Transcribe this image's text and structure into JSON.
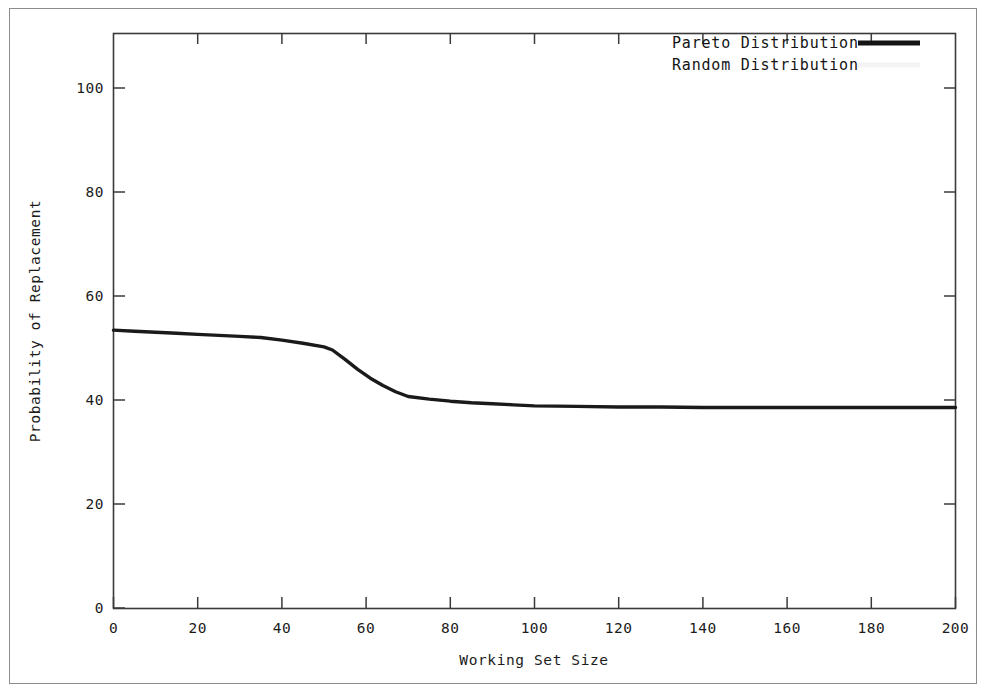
{
  "figure": {
    "background_color": "#ffffff",
    "frame_color": "#8c8c8c",
    "axis_color": "#404040"
  },
  "chart_data": {
    "type": "line",
    "title": "",
    "subtitle": "",
    "xlabel": "Working Set Size",
    "ylabel": "Probability of Replacement",
    "xlim": [
      0,
      200
    ],
    "ylim": [
      0,
      110
    ],
    "xticks": [
      0,
      20,
      40,
      60,
      80,
      100,
      120,
      140,
      160,
      180,
      200
    ],
    "xtick_labels": [
      "0",
      "20",
      "40",
      "60",
      "80",
      "100",
      "120",
      "140",
      "160",
      "180",
      "200"
    ],
    "yticks": [
      0,
      20,
      40,
      60,
      80,
      100
    ],
    "ytick_labels": [
      "0",
      "20",
      "40",
      "60",
      "80",
      "100"
    ],
    "grid": false,
    "legend_position": "top-right",
    "series": [
      {
        "name": "Pareto Distribution",
        "color": "#1a1a1a",
        "line_width": 3.4,
        "visible": true,
        "x": [
          0,
          5,
          10,
          15,
          20,
          25,
          30,
          35,
          40,
          45,
          50,
          52,
          55,
          58,
          61,
          64,
          67,
          70,
          75,
          80,
          85,
          90,
          95,
          100,
          110,
          120,
          130,
          140,
          150,
          160,
          170,
          180,
          190,
          200
        ],
        "y": [
          53.2,
          53.0,
          52.8,
          52.6,
          52.4,
          52.2,
          52.0,
          51.8,
          51.3,
          50.7,
          50.0,
          49.4,
          47.6,
          45.7,
          44.0,
          42.6,
          41.4,
          40.5,
          40.0,
          39.6,
          39.3,
          39.1,
          38.9,
          38.7,
          38.6,
          38.5,
          38.5,
          38.4,
          38.4,
          38.4,
          38.4,
          38.4,
          38.4,
          38.4
        ]
      },
      {
        "name": "Random Distribution",
        "color": "#f2f2f2",
        "line_width": 3.4,
        "visible": false,
        "x": [],
        "y": []
      }
    ],
    "annotations": []
  },
  "legend": {
    "entries": [
      {
        "label": "Pareto Distribution",
        "swatch_color": "#141414",
        "swatch_visible": true
      },
      {
        "label": "Random Distribution",
        "swatch_color": "#f4f4f4",
        "swatch_visible": false
      }
    ]
  }
}
